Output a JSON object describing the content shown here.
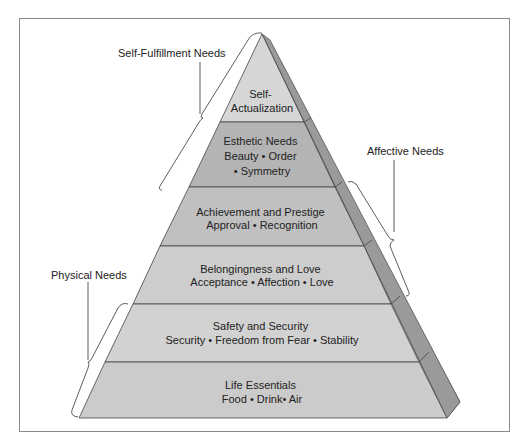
{
  "diagram": {
    "tiers": [
      {
        "name": "Self-Actualization",
        "lines": [
          "Self-",
          "Actualization"
        ],
        "color": "#d6d6d6"
      },
      {
        "name": "Esthetic Needs",
        "lines": [
          "Esthetic Needs",
          "Beauty • Order",
          "• Symmetry"
        ],
        "color": "#b4b4b4"
      },
      {
        "name": "Achievement and Prestige",
        "lines": [
          "Achievement and Prestige",
          "Approval • Recognition"
        ],
        "color": "#c0c0c0"
      },
      {
        "name": "Belongingness and Love",
        "lines": [
          "Belongingness and Love",
          "Acceptance • Affection • Love"
        ],
        "color": "#cdcdcd"
      },
      {
        "name": "Safety and Security",
        "lines": [
          "Safety and Security",
          "Security • Freedom from Fear • Stability"
        ],
        "color": "#d2d2d2"
      },
      {
        "name": "Life Essentials",
        "lines": [
          "Life Essentials",
          "Food • Drink• Air"
        ],
        "color": "#cbcbcb"
      }
    ],
    "groups": [
      {
        "label": "Self-Fulfillment Needs",
        "side": "left",
        "spans": [
          "Self-Actualization",
          "Esthetic Needs"
        ]
      },
      {
        "label": "Affective Needs",
        "side": "right",
        "spans": [
          "Achievement and Prestige",
          "Belongingness and Love"
        ]
      },
      {
        "label": "Physical Needs",
        "side": "left",
        "spans": [
          "Safety and Security",
          "Life Essentials"
        ]
      }
    ],
    "side_face_color": "#8f8f8f"
  }
}
